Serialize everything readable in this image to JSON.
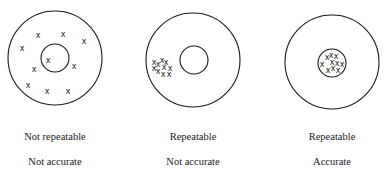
{
  "targets": [
    {
      "id": "not-repeatable-not-accurate",
      "outer": {
        "cx": 55,
        "cy": 58,
        "r": 47
      },
      "inner": {
        "cx": 55,
        "cy": 58,
        "r": 14
      },
      "marks": [
        [
          38,
          35
        ],
        [
          63,
          34
        ],
        [
          84,
          41
        ],
        [
          22,
          48
        ],
        [
          48,
          60
        ],
        [
          34,
          69
        ],
        [
          74,
          66
        ],
        [
          28,
          85
        ],
        [
          47,
          91
        ],
        [
          68,
          91
        ]
      ],
      "label1": "Not repeatable",
      "label2": "Not accurate",
      "label_cx": 55
    },
    {
      "id": "repeatable-not-accurate",
      "outer": {
        "cx": 193,
        "cy": 60,
        "r": 47
      },
      "inner": {
        "cx": 194,
        "cy": 60,
        "r": 14
      },
      "marks": [
        [
          154,
          62
        ],
        [
          158,
          64
        ],
        [
          162,
          60
        ],
        [
          166,
          62
        ],
        [
          154,
          68
        ],
        [
          158,
          71
        ],
        [
          164,
          67
        ],
        [
          170,
          68
        ],
        [
          163,
          74
        ],
        [
          169,
          74
        ]
      ],
      "label1": "Repeatable",
      "label2": "Not accurate",
      "label_cx": 193
    },
    {
      "id": "repeatable-accurate",
      "outer": {
        "cx": 332,
        "cy": 62,
        "r": 47
      },
      "inner": {
        "cx": 332,
        "cy": 63,
        "r": 14
      },
      "marks": [
        [
          327,
          57
        ],
        [
          331,
          55
        ],
        [
          336,
          56
        ],
        [
          322,
          64
        ],
        [
          332,
          62
        ],
        [
          337,
          63
        ],
        [
          342,
          64
        ],
        [
          328,
          70
        ],
        [
          333,
          68
        ],
        [
          338,
          70
        ]
      ],
      "label1": "Repeatable",
      "label2": "Accurate",
      "label_cx": 332
    }
  ],
  "mark_glyph": "x",
  "colors": {
    "stroke": "#1a1a1a",
    "text": "#1a1a1a",
    "background": "#ffffff"
  }
}
